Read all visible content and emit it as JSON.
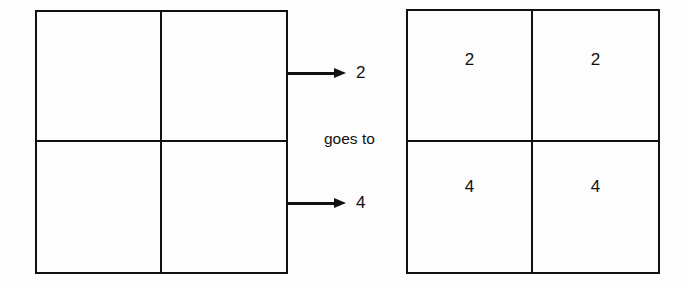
{
  "diagram": {
    "caption": "goes to",
    "source_grid": {
      "name": "source-matrix",
      "rows": 2,
      "columns": 2,
      "cells": [
        {
          "position": "top-left",
          "value": ""
        },
        {
          "position": "top-right",
          "value": ""
        },
        {
          "position": "bottom-left",
          "value": ""
        },
        {
          "position": "bottom-right",
          "value": ""
        }
      ]
    },
    "arrows": [
      {
        "name": "row-1-arrow",
        "label": "2",
        "direction": "right"
      },
      {
        "name": "row-2-arrow",
        "label": "4",
        "direction": "right"
      }
    ],
    "result_grid": {
      "name": "result-matrix",
      "rows": 2,
      "columns": 2,
      "cells": [
        {
          "position": "top-left",
          "value": "2"
        },
        {
          "position": "top-right",
          "value": "2"
        },
        {
          "position": "bottom-left",
          "value": "4"
        },
        {
          "position": "bottom-right",
          "value": "4"
        }
      ]
    },
    "colors": {
      "line": "#111111",
      "background": "#fdfdfd",
      "text": "#111111"
    }
  }
}
